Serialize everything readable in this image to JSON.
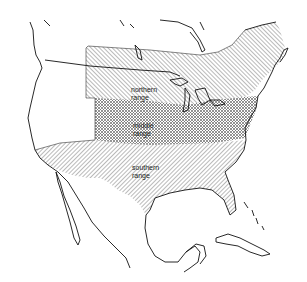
{
  "map": {
    "title": "",
    "regions": [
      {
        "id": "northern",
        "label_line1": "northern",
        "label_line2": "range",
        "pattern": "diagonal-hatch"
      },
      {
        "id": "middle",
        "label_line1": "middle",
        "label_line2": "range",
        "pattern": "crosshatch"
      },
      {
        "id": "southern",
        "label_line1": "southern",
        "label_line2": "range",
        "pattern": "diagonal-hatch"
      }
    ],
    "colors": {
      "outline": "#111111",
      "hatch": "#555555",
      "background": "#ffffff"
    }
  }
}
